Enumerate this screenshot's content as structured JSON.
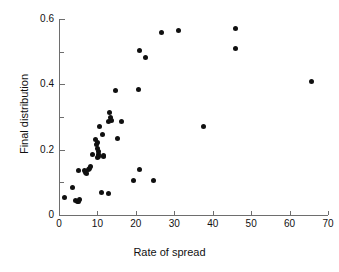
{
  "chart_data": {
    "type": "scatter",
    "title": "",
    "xlabel": "Rate of spread",
    "ylabel": "Final distribution",
    "xlim": [
      0,
      70
    ],
    "ylim": [
      0,
      0.6
    ],
    "xticks": [
      0,
      10,
      20,
      30,
      40,
      50,
      60,
      70
    ],
    "xticklabels": [
      "0",
      "10",
      "20",
      "30",
      "40",
      "50",
      "60",
      "70"
    ],
    "yticks": [
      0,
      0.2,
      0.4,
      0.6
    ],
    "yticklabels": [
      "0",
      "0.2",
      "0.4",
      "0.6"
    ],
    "yminorticks": [
      0.1,
      0.3,
      0.5
    ],
    "grid": false,
    "legend": null,
    "marker": "filled-circle",
    "marker_color": "#101010",
    "points": [
      {
        "x": 1.5,
        "y": 0.055
      },
      {
        "x": 3.4,
        "y": 0.085
      },
      {
        "x": 4.4,
        "y": 0.045
      },
      {
        "x": 4.8,
        "y": 0.04
      },
      {
        "x": 5.1,
        "y": 0.042
      },
      {
        "x": 5.4,
        "y": 0.046
      },
      {
        "x": 5.0,
        "y": 0.135
      },
      {
        "x": 6.6,
        "y": 0.135
      },
      {
        "x": 7.0,
        "y": 0.13
      },
      {
        "x": 7.2,
        "y": 0.127
      },
      {
        "x": 7.6,
        "y": 0.14
      },
      {
        "x": 7.9,
        "y": 0.142
      },
      {
        "x": 8.2,
        "y": 0.148
      },
      {
        "x": 8.6,
        "y": 0.185
      },
      {
        "x": 9.6,
        "y": 0.232
      },
      {
        "x": 9.7,
        "y": 0.215
      },
      {
        "x": 9.9,
        "y": 0.205
      },
      {
        "x": 10.1,
        "y": 0.222
      },
      {
        "x": 10.3,
        "y": 0.195
      },
      {
        "x": 10.4,
        "y": 0.185
      },
      {
        "x": 10.0,
        "y": 0.175
      },
      {
        "x": 10.2,
        "y": 0.178
      },
      {
        "x": 10.6,
        "y": 0.27
      },
      {
        "x": 11.3,
        "y": 0.245
      },
      {
        "x": 11.5,
        "y": 0.18
      },
      {
        "x": 11.7,
        "y": 0.182
      },
      {
        "x": 11.0,
        "y": 0.07
      },
      {
        "x": 13.0,
        "y": 0.065
      },
      {
        "x": 12.8,
        "y": 0.285
      },
      {
        "x": 13.2,
        "y": 0.315
      },
      {
        "x": 13.4,
        "y": 0.3
      },
      {
        "x": 13.7,
        "y": 0.29
      },
      {
        "x": 14.8,
        "y": 0.38
      },
      {
        "x": 15.3,
        "y": 0.235
      },
      {
        "x": 16.3,
        "y": 0.285
      },
      {
        "x": 19.5,
        "y": 0.105
      },
      {
        "x": 20.6,
        "y": 0.385
      },
      {
        "x": 20.9,
        "y": 0.505
      },
      {
        "x": 21.0,
        "y": 0.14
      },
      {
        "x": 22.6,
        "y": 0.482
      },
      {
        "x": 24.5,
        "y": 0.105
      },
      {
        "x": 26.8,
        "y": 0.558
      },
      {
        "x": 31.0,
        "y": 0.565
      },
      {
        "x": 37.5,
        "y": 0.27
      },
      {
        "x": 45.8,
        "y": 0.57
      },
      {
        "x": 46.0,
        "y": 0.51
      },
      {
        "x": 65.8,
        "y": 0.41
      }
    ]
  }
}
